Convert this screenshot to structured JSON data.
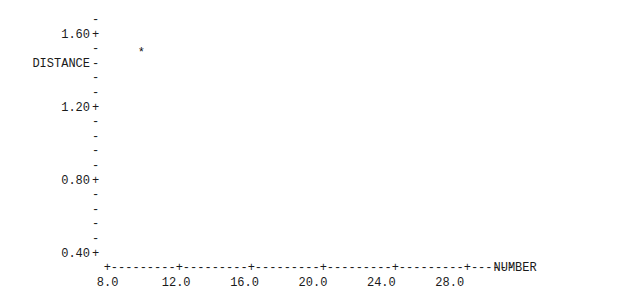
{
  "chart_data": {
    "type": "scatter",
    "title": "",
    "xlabel": "NUMBER",
    "ylabel": "DISTANCE",
    "marker": "*",
    "style": "ascii-character-plot",
    "grid": false,
    "legend": null,
    "xlim": [
      7.0,
      30.5
    ],
    "ylim": [
      0.37,
      1.72
    ],
    "x_major_ticks": [
      8.0,
      10.0,
      12.0,
      14.0,
      16.0,
      18.0,
      20.0,
      22.0,
      24.0,
      26.0,
      28.0,
      30.0
    ],
    "x_tick_labels": [
      "8.0",
      "12.0",
      "16.0",
      "20.0",
      "24.0",
      "28.0"
    ],
    "x_labeled_ticks": [
      8.0,
      12.0,
      16.0,
      20.0,
      24.0,
      28.0
    ],
    "y_major_ticks": [
      0.4,
      0.8,
      1.2,
      1.6
    ],
    "y_tick_labels": [
      "0.40+",
      "0.80+",
      "1.20+",
      "1.60+"
    ],
    "y_minor_marker": "-",
    "x": [
      10.0,
      12.8,
      19.8,
      22.5,
      26.9,
      29.0
    ],
    "y": [
      1.7,
      1.14,
      0.79,
      0.6,
      0.4,
      0.4
    ],
    "points": [
      {
        "x": 10.0,
        "y": 1.7,
        "marker": "*"
      },
      {
        "x": 12.8,
        "y": 1.14,
        "marker": "*"
      },
      {
        "x": 19.8,
        "y": 0.79,
        "marker": "*"
      },
      {
        "x": 22.5,
        "y": 0.6,
        "marker": "*"
      },
      {
        "x": 26.9,
        "y": 0.4,
        "marker": "*"
      },
      {
        "x": 29.0,
        "y": 0.4,
        "marker": "*"
      }
    ]
  },
  "plot": {
    "y_axis_label": "DISTANCE",
    "x_axis_label": "NUMBER",
    "y_rows": [
      {
        "label": "",
        "tick": "-"
      },
      {
        "label": "1.60",
        "tick": "+"
      },
      {
        "label": "",
        "tick": "-"
      },
      {
        "label": "DISTANCE",
        "tick": "-"
      },
      {
        "label": "",
        "tick": "-"
      },
      {
        "label": "",
        "tick": "-"
      },
      {
        "label": "1.20",
        "tick": "+"
      },
      {
        "label": "",
        "tick": "-"
      },
      {
        "label": "",
        "tick": "-"
      },
      {
        "label": "",
        "tick": "-"
      },
      {
        "label": "",
        "tick": "-"
      },
      {
        "label": "0.80",
        "tick": "+"
      },
      {
        "label": "",
        "tick": "-"
      },
      {
        "label": "",
        "tick": "-"
      },
      {
        "label": "",
        "tick": "-"
      },
      {
        "label": "",
        "tick": "-"
      },
      {
        "label": "0.40",
        "tick": "+"
      }
    ],
    "x_axis_line": "+---------+---------+---------+---------+---------+------",
    "x_tick_labels": [
      "8.0",
      "12.0",
      "16.0",
      "20.0",
      "24.0",
      "28.0"
    ],
    "markers": [
      "*",
      "*",
      "*",
      "*",
      "*",
      "*"
    ],
    "colors": {
      "background": "#ffffff",
      "ink": "#1a1a1a",
      "marker": "#111111"
    }
  }
}
